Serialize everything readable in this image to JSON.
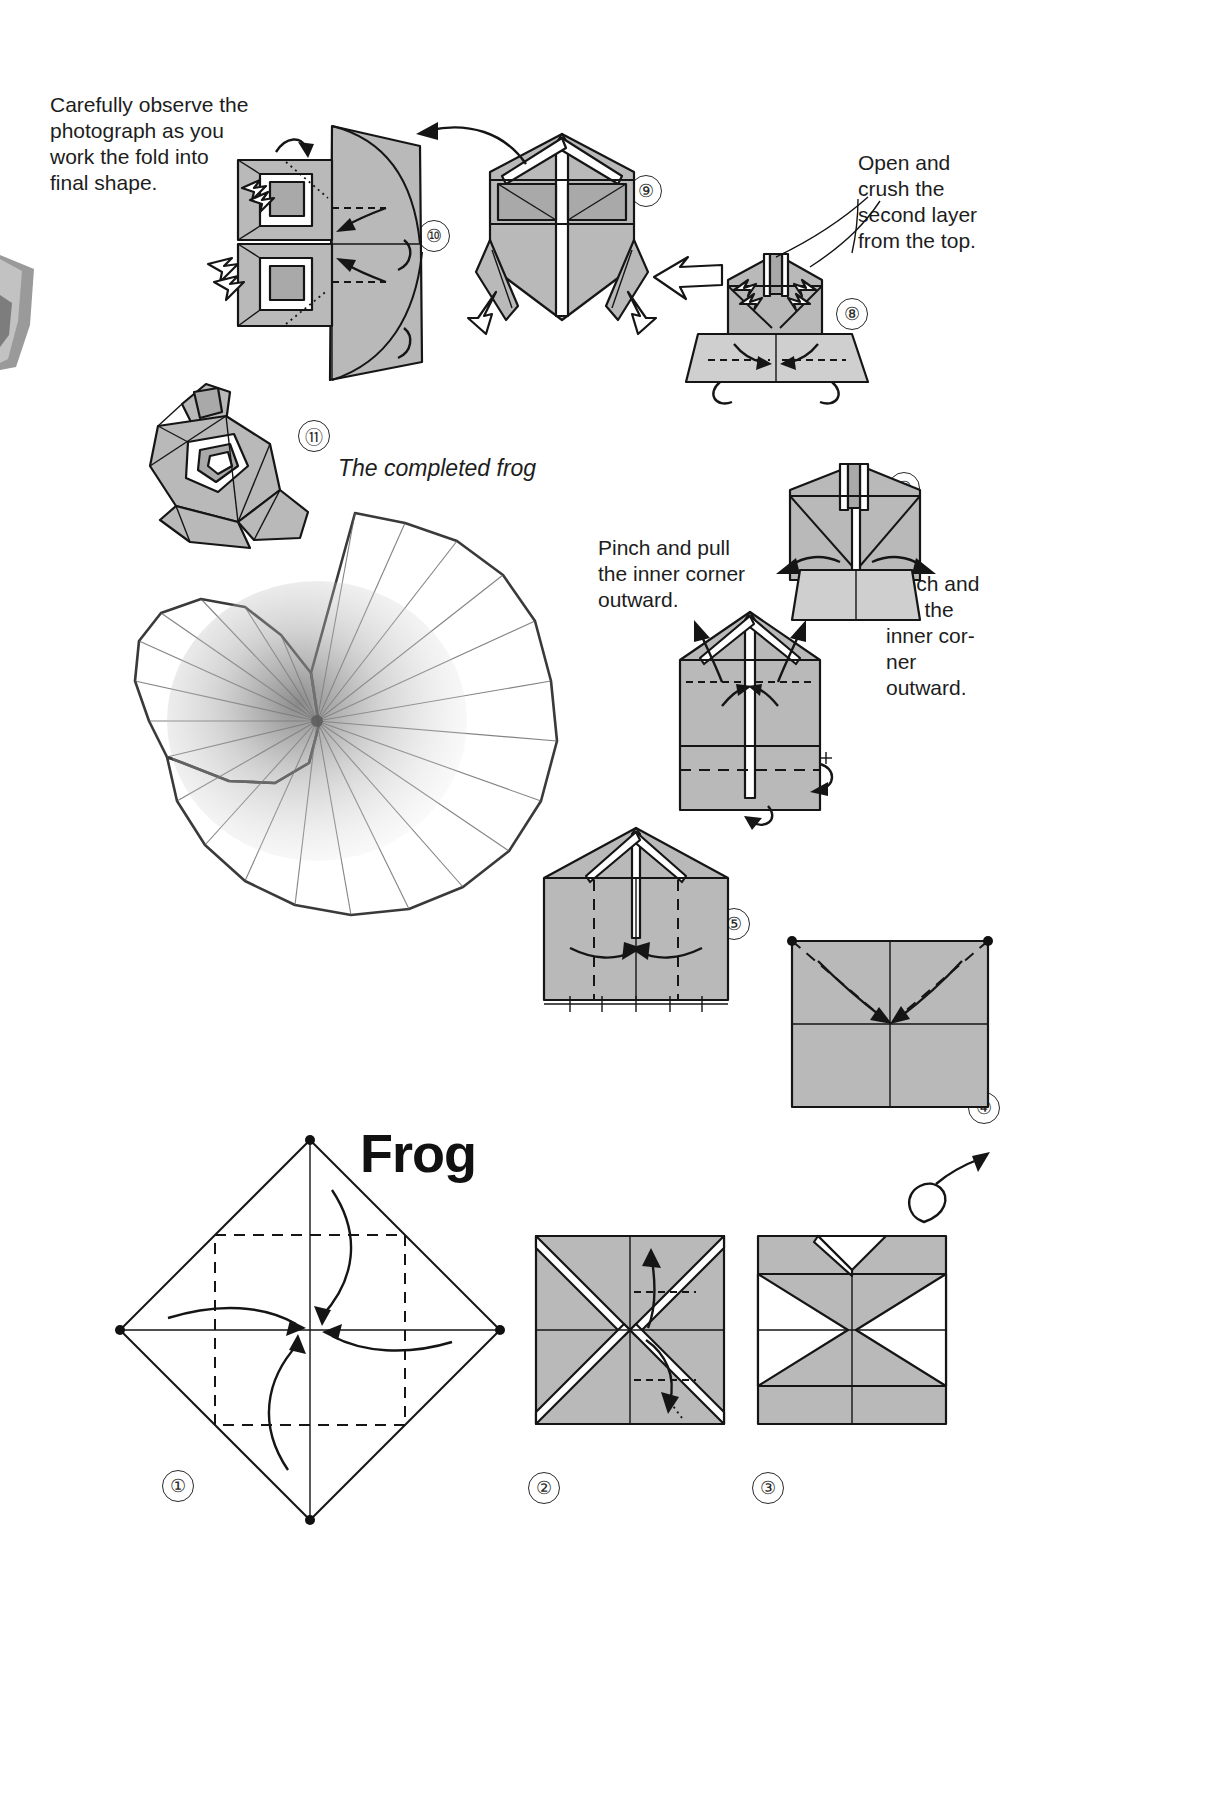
{
  "page": {
    "title": "Frog",
    "background_color": "#ffffff",
    "paper_color": "#b9b9b9",
    "ink_color": "#151515"
  },
  "annotations": {
    "observe_note": "Carefully observe the\nphotograph as you\nwork the fold into\nfinal shape.",
    "open_crush_note": "Open and\ncrush the\nsecond layer\nfrom the top.",
    "pinch_left_note": "Pinch and pull\nthe inner corner\noutward.",
    "pinch_right_note": "Pinch and\npull the\ninner cor-\nner\noutward.",
    "completed_caption": "The completed frog"
  },
  "steps": [
    {
      "id": 1,
      "label": "①",
      "caption": "Fold the four corners of the square to the center point."
    },
    {
      "id": 2,
      "label": "②",
      "caption": "Fold the edges to the center, forming a smaller square."
    },
    {
      "id": 3,
      "label": "③",
      "caption": "Fold the flaps outward to make the pinwheel shape."
    },
    {
      "id": 4,
      "label": "④",
      "caption": "Turn the model over and fold the diagonals to the center."
    },
    {
      "id": 5,
      "label": "⑤",
      "caption": "Fold both side flaps in toward the center line."
    },
    {
      "id": 6,
      "label": "⑥",
      "caption": "Pinch and pull the inner corner outward."
    },
    {
      "id": 7,
      "label": "⑦",
      "caption": "Pinch and pull the inner corner outward."
    },
    {
      "id": 8,
      "label": "⑧",
      "caption": "Open and crush the second layer from the top."
    },
    {
      "id": 9,
      "label": "⑨",
      "caption": "Pull the legs outward to shape the frog."
    },
    {
      "id": 10,
      "label": "⑩",
      "caption": "Carefully observe the photograph as you work the fold into final shape."
    },
    {
      "id": 11,
      "label": "⑪",
      "caption": "The completed frog."
    }
  ],
  "figures": {
    "lily_pad": "pencil-drawn lily pad with radial pleats",
    "completed_frog": "folded paper frog resting on the lily pad"
  }
}
